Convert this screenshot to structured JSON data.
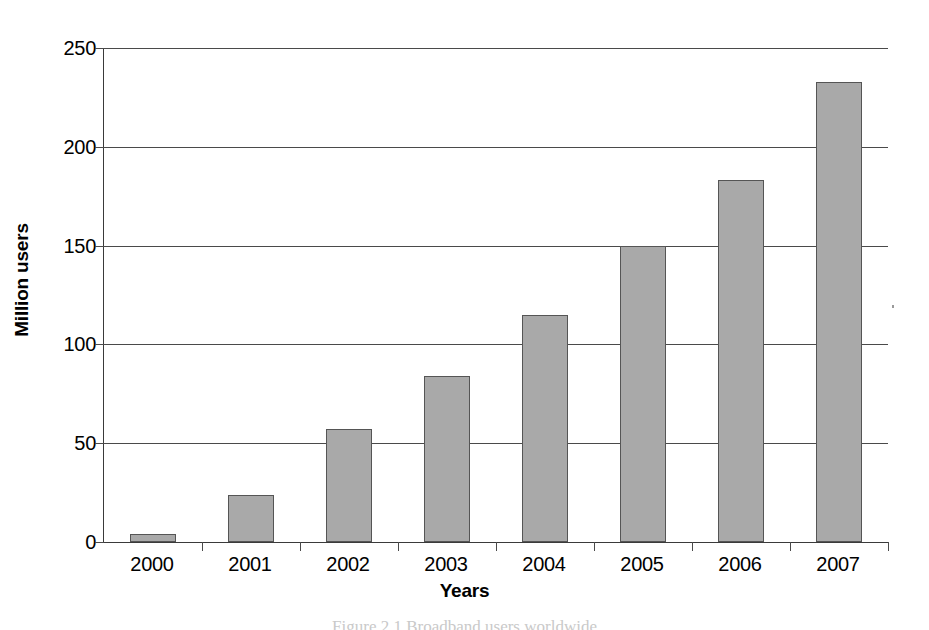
{
  "chart_data": {
    "type": "bar",
    "title": "",
    "xlabel": "Years",
    "ylabel": "Million users",
    "categories": [
      "2000",
      "2001",
      "2002",
      "2003",
      "2004",
      "2005",
      "2006",
      "2007"
    ],
    "values": [
      4,
      24,
      57,
      84,
      115,
      150,
      183,
      233
    ],
    "series": [
      {
        "name": "Million users",
        "values": [
          4,
          24,
          57,
          84,
          115,
          150,
          183,
          233
        ]
      }
    ],
    "ylim": [
      0,
      250
    ],
    "yticks": [
      0,
      50,
      100,
      150,
      200,
      250
    ],
    "ytick_labels": [
      "0",
      "50",
      "100",
      "150",
      "200",
      "250"
    ],
    "grid": "horizontal",
    "legend": "none",
    "bar_color": "#a9a9a9",
    "bar_border_color": "#555555",
    "axis_color": "#4a4a4a",
    "background": "#ffffff"
  },
  "caption": {
    "text": "Figure 2.1 Broadband users worldwide",
    "visible": "partial-cut-off"
  }
}
